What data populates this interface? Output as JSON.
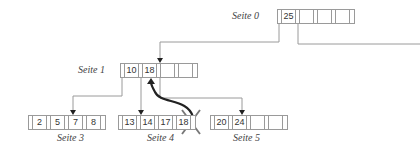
{
  "diagram": {
    "type": "b-tree-deletion",
    "pages": [
      {
        "id": "seite0",
        "label": "Seite 0",
        "keys": [
          "25",
          "",
          "",
          ""
        ]
      },
      {
        "id": "seite1",
        "label": "Seite 1",
        "keys": [
          "10",
          "18",
          "",
          "",
          ""
        ]
      },
      {
        "id": "seite3",
        "label": "Seite 3",
        "keys": [
          "2",
          "5",
          "7",
          "8"
        ]
      },
      {
        "id": "seite4",
        "label": "Seite 4",
        "keys": [
          "13",
          "14",
          "17",
          "18"
        ]
      },
      {
        "id": "seite5",
        "label": "Seite 5",
        "keys": [
          "20",
          "24",
          "",
          "",
          ""
        ]
      }
    ],
    "deleted_key": "18",
    "moved_key_arrow": {
      "from": "Seite 4 key 18",
      "to": "Seite 1 key 18"
    },
    "colors": {
      "lines": "#9a9a9a",
      "arrow": "#222222",
      "cross": "#777777"
    }
  }
}
